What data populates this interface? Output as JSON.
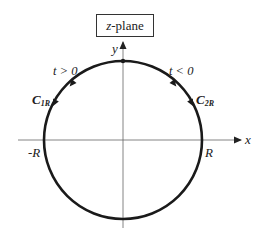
{
  "title": "z-plane",
  "title_parts": {
    "var": "z",
    "rest": "-plane"
  },
  "axes": {
    "x_label": "x",
    "y_label": "y",
    "neg_R": "-R",
    "pos_R": "R"
  },
  "contours": [
    {
      "name": "C",
      "sub": "1R",
      "condition": "t > 0",
      "side": "left",
      "direction": "counterclockwise-downward"
    },
    {
      "name": "C",
      "sub": "2R",
      "condition": "t < 0",
      "side": "right",
      "direction": "clockwise-downward"
    }
  ],
  "colors": {
    "stroke": "#1a1a1a",
    "axis": "#555555",
    "text": "#222222"
  }
}
